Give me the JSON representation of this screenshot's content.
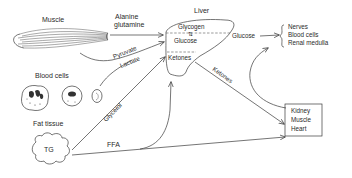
{
  "diagram": {
    "type": "metabolic-flow",
    "colors": {
      "ink": "#2a2a2a",
      "background": "#ffffff"
    },
    "sources": {
      "muscle": {
        "label": "Muscle"
      },
      "blood_cells": {
        "label": "Blood cells"
      },
      "fat_tissue": {
        "label": "Fat tissue",
        "inner_label": "TG"
      }
    },
    "liver": {
      "label": "Liver",
      "compartments": [
        "Glycogen",
        "Glucose",
        "Ketones"
      ],
      "interconversion_symbol": "⇅"
    },
    "flows": {
      "alanine": "Alanine",
      "glutamine": "glutamine",
      "pyruvate": "Pyruvate",
      "lactate": "Lactate",
      "glycerol": "Glycerol",
      "ffa": "FFA",
      "glucose_out": "Glucose",
      "ketones_out": "Ketones"
    },
    "glucose_targets": [
      "Nerves",
      "Blood cells",
      "Renal medulla"
    ],
    "fuel_targets": [
      "Kidney",
      "Muscle",
      "Heart"
    ]
  }
}
